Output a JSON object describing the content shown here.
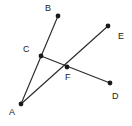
{
  "figure": {
    "background_color": "#ffffff",
    "line_color": "#2b2b2b",
    "point_color": "#1a1a1a",
    "label_color": "#1a1a1a",
    "width": 132,
    "height": 126
  },
  "points": [
    {
      "id": "A",
      "label": "A",
      "x": 21,
      "y": 104,
      "label_x": 9,
      "label_y": 108
    },
    {
      "id": "B",
      "label": "B",
      "x": 58,
      "y": 16,
      "label_x": 45,
      "label_y": 4
    },
    {
      "id": "C",
      "label": "C",
      "x": 41,
      "y": 56,
      "label_x": 23,
      "label_y": 45
    },
    {
      "id": "D",
      "label": "D",
      "x": 110,
      "y": 83,
      "label_x": 112,
      "label_y": 92
    },
    {
      "id": "E",
      "label": "E",
      "x": 108,
      "y": 26,
      "label_x": 118,
      "label_y": 32
    },
    {
      "id": "F",
      "label": "F",
      "x": 67,
      "y": 67,
      "label_x": 65,
      "label_y": 73
    }
  ],
  "segments": [
    {
      "id": "AB",
      "from": "A",
      "to": "B",
      "x1": 21,
      "y1": 104,
      "x2": 58,
      "y2": 16,
      "passes_through": [
        "C"
      ]
    },
    {
      "id": "AE",
      "from": "A",
      "to": "E",
      "x1": 21,
      "y1": 104,
      "x2": 108,
      "y2": 26,
      "passes_through": [
        "F"
      ]
    },
    {
      "id": "CD",
      "from": "C",
      "to": "D",
      "x1": 41,
      "y1": 56,
      "x2": 110,
      "y2": 83,
      "passes_through": [
        "F"
      ]
    }
  ],
  "labels": {
    "A": "A",
    "B": "B",
    "C": "C",
    "D": "D",
    "E": "E",
    "F": "F"
  }
}
